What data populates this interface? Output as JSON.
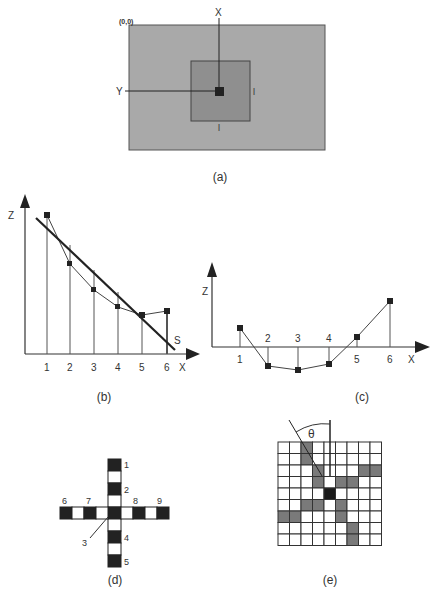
{
  "figure": {
    "panel_a": {
      "caption": "(a)",
      "origin_label": "(0,0)",
      "x_label": "X",
      "y_label": "Y",
      "side_label_right": "l",
      "side_label_bottom": "l",
      "colors": {
        "outer": "#a9a9a9",
        "inner": "#8f8f8f",
        "center": "#222222"
      }
    },
    "panel_b": {
      "caption": "(b)",
      "z_label": "Z",
      "x_label": "X",
      "line_label": "S",
      "ticks": [
        "1",
        "2",
        "3",
        "4",
        "5",
        "6"
      ]
    },
    "panel_c": {
      "caption": "(c)",
      "z_label": "Z",
      "x_label": "X",
      "ticks": [
        "1",
        "2",
        "3",
        "4",
        "5",
        "6"
      ]
    },
    "panel_d": {
      "caption": "(d)",
      "labels": [
        "1",
        "2",
        "3",
        "4",
        "5",
        "6",
        "7",
        "8",
        "9"
      ]
    },
    "panel_e": {
      "caption": "(e)",
      "angle_label": "θ",
      "grid_size": 9,
      "center": [
        4,
        4
      ],
      "gray_cells": [
        [
          0,
          2
        ],
        [
          1,
          2
        ],
        [
          2,
          3
        ],
        [
          2,
          7
        ],
        [
          2,
          8
        ],
        [
          3,
          3
        ],
        [
          3,
          5
        ],
        [
          3,
          6
        ],
        [
          5,
          2
        ],
        [
          5,
          3
        ],
        [
          5,
          5
        ],
        [
          6,
          0
        ],
        [
          6,
          1
        ],
        [
          6,
          5
        ],
        [
          7,
          6
        ],
        [
          8,
          6
        ]
      ]
    }
  },
  "chart_data": [
    {
      "type": "line",
      "title": "(b)",
      "xlabel": "X",
      "ylabel": "Z",
      "x": [
        1,
        2,
        3,
        4,
        5,
        6
      ],
      "series": [
        {
          "name": "profile",
          "values": [
            9.0,
            6.4,
            5.0,
            4.0,
            3.6,
            3.8
          ]
        },
        {
          "name": "S (fitted line)",
          "values": [
            8.0,
            6.7,
            5.4,
            4.1,
            2.8,
            1.5
          ]
        }
      ],
      "annotations": [
        "S"
      ]
    },
    {
      "type": "line",
      "title": "(c)",
      "xlabel": "X",
      "ylabel": "Z",
      "x": [
        1,
        2,
        3,
        4,
        5,
        6
      ],
      "series": [
        {
          "name": "residual",
          "values": [
            1.8,
            -1.8,
            -2.2,
            -1.6,
            0.9,
            4.6
          ]
        }
      ]
    }
  ]
}
